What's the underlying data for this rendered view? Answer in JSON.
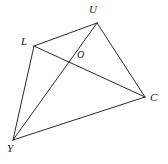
{
  "figure": {
    "type": "geometry-diagram",
    "background_color": "#ffffff",
    "stroke_color": "#2b2b2b",
    "label_color": "#1a1a1a",
    "stroke_width": 1,
    "points": {
      "U": {
        "label": "U",
        "x": 97,
        "y": 23
      },
      "L": {
        "label": "L",
        "x": 34,
        "y": 46
      },
      "O": {
        "label": "O",
        "x": 72,
        "y": 62
      },
      "C": {
        "label": "C",
        "x": 145,
        "y": 97
      },
      "Y": {
        "label": "Y",
        "x": 13,
        "y": 140
      }
    },
    "segments": [
      {
        "name": "L-U",
        "from": "L",
        "to": "U",
        "kind": "side"
      },
      {
        "name": "U-C",
        "from": "U",
        "to": "C",
        "kind": "side"
      },
      {
        "name": "C-Y",
        "from": "C",
        "to": "Y",
        "kind": "side"
      },
      {
        "name": "Y-L",
        "from": "Y",
        "to": "L",
        "kind": "side"
      },
      {
        "name": "L-C",
        "from": "L",
        "to": "C",
        "kind": "diagonal"
      },
      {
        "name": "U-Y",
        "from": "U",
        "to": "Y",
        "kind": "diagonal"
      }
    ]
  }
}
